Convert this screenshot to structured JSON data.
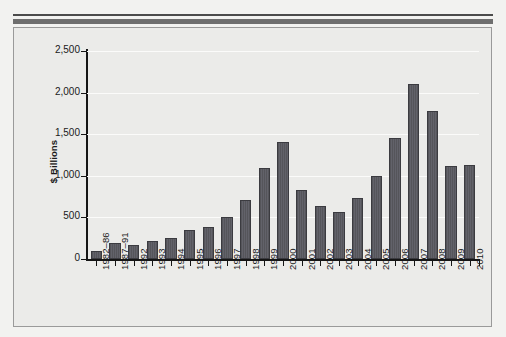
{
  "chart_data": {
    "type": "bar",
    "title": "",
    "subtitle": "",
    "xlabel": "",
    "ylabel": "$ Billions",
    "ylim": [
      0,
      2500
    ],
    "ytick_labels": [
      "0",
      "500",
      "1,000",
      "1,500",
      "2,000",
      "2,500"
    ],
    "ytick_values": [
      0,
      500,
      1000,
      1500,
      2000,
      2500
    ],
    "grid": true,
    "legend": null,
    "bar_color": "#59595e",
    "categories": [
      "1982–86",
      "1987–91",
      "1992",
      "1993",
      "1994",
      "1995",
      "1996",
      "1997",
      "1998",
      "1999",
      "2000",
      "2001",
      "2002",
      "2003",
      "2004",
      "2005",
      "2006",
      "2007",
      "2008",
      "2009",
      "2010"
    ],
    "values": [
      100,
      195,
      165,
      220,
      255,
      350,
      390,
      500,
      710,
      1095,
      1405,
      835,
      640,
      565,
      735,
      1000,
      1460,
      2105,
      1775,
      1120,
      1130
    ]
  },
  "figure": {
    "background_color": "#ebebe9",
    "frame_border_color": "#9a9a9a",
    "rule_thin_color": "#4b4b4b",
    "rule_thick_color": "#6e6e6e"
  }
}
